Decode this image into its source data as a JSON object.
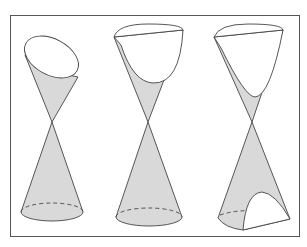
{
  "figure": {
    "panels": [
      {
        "name": "ellipse",
        "label": ""
      },
      {
        "name": "parabola",
        "label": ""
      },
      {
        "name": "hyperbola",
        "label": ""
      }
    ],
    "colors": {
      "cone_fill": "#d9d9d9",
      "stroke": "#444444",
      "frame": "#555555",
      "background": "#ffffff"
    }
  }
}
